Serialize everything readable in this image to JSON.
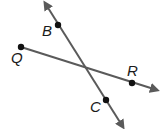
{
  "diagram": {
    "lines": [
      {
        "name": "line-BC",
        "x1": 45,
        "y1": 3,
        "x2": 123,
        "y2": 127,
        "arrows": [
          "start",
          "end"
        ]
      },
      {
        "name": "ray-QR",
        "x1": 21,
        "y1": 47,
        "x2": 157,
        "y2": 90,
        "arrows": [
          "end"
        ]
      }
    ],
    "points": [
      {
        "id": "B",
        "x": 58,
        "y": 25,
        "label": "B",
        "lx": 42,
        "ly": 36
      },
      {
        "id": "Q",
        "x": 21,
        "y": 47,
        "label": "Q",
        "lx": 11,
        "ly": 63
      },
      {
        "id": "R",
        "x": 132,
        "y": 83,
        "label": "R",
        "lx": 127,
        "ly": 76
      },
      {
        "id": "C",
        "x": 106,
        "y": 100,
        "label": "C",
        "lx": 90,
        "ly": 112
      }
    ],
    "colors": {
      "line": "#5a5a5a",
      "point": "#111111",
      "label": "#1a1a1a"
    }
  }
}
